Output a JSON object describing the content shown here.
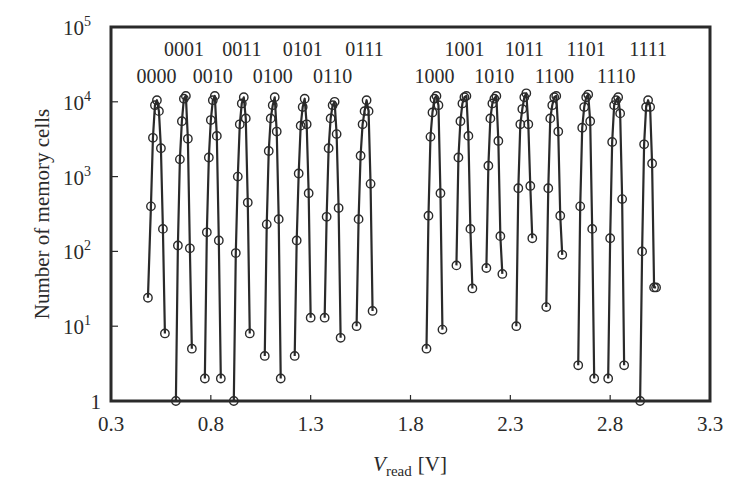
{
  "chart_data": {
    "type": "line",
    "title": "",
    "xlabel": "V_read [V]",
    "xlabel_main": "V",
    "xlabel_sub": "read",
    "xlabel_unit": "[V]",
    "ylabel": "Number of memory cells",
    "xscale": "linear",
    "yscale": "log",
    "xlim": [
      0.3,
      3.3
    ],
    "ylim": [
      1,
      100000
    ],
    "grid": false,
    "legend": null,
    "x_ticks": [
      "0.3",
      "0.8",
      "1.3",
      "1.8",
      "2.3",
      "2.8",
      "3.3"
    ],
    "x_tick_values": [
      0.3,
      0.8,
      1.3,
      1.8,
      2.3,
      2.8,
      3.3
    ],
    "y_ticks": [
      {
        "base": "1",
        "exp": "",
        "value": 1
      },
      {
        "base": "10",
        "exp": "1",
        "value": 10
      },
      {
        "base": "10",
        "exp": "2",
        "value": 100
      },
      {
        "base": "10",
        "exp": "3",
        "value": 1000
      },
      {
        "base": "10",
        "exp": "4",
        "value": 10000
      },
      {
        "base": "10",
        "exp": "5",
        "value": 100000
      }
    ],
    "marker": "open-circle",
    "series": [
      {
        "name": "0000",
        "label_row": "lower",
        "x": [
          0.485,
          0.5,
          0.51,
          0.52,
          0.53,
          0.54,
          0.55,
          0.56,
          0.57
        ],
        "y": [
          24,
          400,
          3300,
          9000,
          10500,
          7500,
          2400,
          200,
          8
        ]
      },
      {
        "name": "0001",
        "label_row": "upper",
        "x": [
          0.625,
          0.635,
          0.645,
          0.655,
          0.665,
          0.675,
          0.685,
          0.695,
          0.705
        ],
        "y": [
          1,
          120,
          1700,
          5500,
          11000,
          12000,
          3200,
          110,
          5
        ]
      },
      {
        "name": "0010",
        "label_row": "lower",
        "x": [
          0.77,
          0.78,
          0.79,
          0.8,
          0.81,
          0.82,
          0.83,
          0.84,
          0.85
        ],
        "y": [
          2,
          180,
          1800,
          5700,
          10500,
          12000,
          3500,
          140,
          2
        ]
      },
      {
        "name": "0011",
        "label_row": "upper",
        "x": [
          0.915,
          0.925,
          0.935,
          0.945,
          0.955,
          0.965,
          0.975,
          0.985,
          0.995
        ],
        "y": [
          1,
          95,
          1000,
          5000,
          9500,
          11500,
          6000,
          450,
          8
        ]
      },
      {
        "name": "0100",
        "label_row": "lower",
        "x": [
          1.07,
          1.08,
          1.09,
          1.1,
          1.11,
          1.12,
          1.13,
          1.14,
          1.15
        ],
        "y": [
          4,
          230,
          2200,
          6000,
          9000,
          11500,
          4000,
          270,
          2
        ]
      },
      {
        "name": "0101",
        "label_row": "upper",
        "x": [
          1.22,
          1.23,
          1.24,
          1.25,
          1.26,
          1.27,
          1.28,
          1.29,
          1.3
        ],
        "y": [
          4,
          140,
          1100,
          4800,
          8500,
          11000,
          5000,
          600,
          13
        ]
      },
      {
        "name": "0110",
        "label_row": "lower",
        "x": [
          1.37,
          1.38,
          1.39,
          1.4,
          1.41,
          1.42,
          1.43,
          1.44,
          1.45
        ],
        "y": [
          13,
          290,
          2400,
          6000,
          9000,
          10000,
          3700,
          380,
          7
        ]
      },
      {
        "name": "0111",
        "label_row": "upper",
        "x": [
          1.53,
          1.54,
          1.55,
          1.56,
          1.57,
          1.58,
          1.59,
          1.6,
          1.61
        ],
        "y": [
          10,
          270,
          1900,
          5000,
          7500,
          10500,
          7500,
          800,
          16
        ]
      },
      {
        "name": "1000",
        "label_row": "lower",
        "x": [
          1.88,
          1.89,
          1.9,
          1.91,
          1.92,
          1.93,
          1.94,
          1.95,
          1.96
        ],
        "y": [
          5,
          300,
          3400,
          7200,
          11000,
          12000,
          9000,
          600,
          9
        ]
      },
      {
        "name": "1001",
        "label_row": "upper",
        "x": [
          2.03,
          2.04,
          2.05,
          2.06,
          2.07,
          2.08,
          2.09,
          2.1,
          2.11
        ],
        "y": [
          65,
          1800,
          5500,
          9500,
          11500,
          12000,
          3500,
          200,
          32
        ]
      },
      {
        "name": "1010",
        "label_row": "lower",
        "x": [
          2.18,
          2.19,
          2.2,
          2.21,
          2.22,
          2.23,
          2.24,
          2.25,
          2.26
        ],
        "y": [
          60,
          1400,
          6000,
          9500,
          11000,
          12000,
          3000,
          160,
          50
        ]
      },
      {
        "name": "1011",
        "label_row": "upper",
        "x": [
          2.33,
          2.34,
          2.35,
          2.36,
          2.37,
          2.38,
          2.39,
          2.4,
          2.41
        ],
        "y": [
          10,
          700,
          5000,
          8000,
          11500,
          13000,
          5000,
          750,
          150
        ]
      },
      {
        "name": "1100",
        "label_row": "lower",
        "x": [
          2.48,
          2.49,
          2.5,
          2.51,
          2.52,
          2.53,
          2.54,
          2.55,
          2.56
        ],
        "y": [
          18,
          700,
          6000,
          9000,
          11500,
          12000,
          4000,
          300,
          90
        ]
      },
      {
        "name": "1101",
        "label_row": "upper",
        "x": [
          2.64,
          2.65,
          2.66,
          2.67,
          2.68,
          2.69,
          2.7,
          2.71,
          2.72
        ],
        "y": [
          3,
          400,
          4500,
          8500,
          11500,
          12500,
          5500,
          200,
          2
        ]
      },
      {
        "name": "1110",
        "label_row": "lower",
        "x": [
          2.79,
          2.8,
          2.81,
          2.82,
          2.83,
          2.84,
          2.85,
          2.86,
          2.87
        ],
        "y": [
          2,
          150,
          2900,
          9000,
          10500,
          11500,
          7000,
          500,
          3
        ]
      },
      {
        "name": "1111",
        "label_row": "upper",
        "x": [
          2.95,
          2.96,
          2.97,
          2.98,
          2.99,
          3.0,
          3.01,
          3.02,
          3.03
        ],
        "y": [
          1,
          100,
          2700,
          8500,
          10500,
          8500,
          1500,
          33,
          33
        ]
      }
    ],
    "annotations": [
      "0000",
      "0001",
      "0010",
      "0011",
      "0100",
      "0101",
      "0110",
      "0111",
      "1000",
      "1001",
      "1010",
      "1011",
      "1100",
      "1101",
      "1110",
      "1111"
    ]
  },
  "layout": {
    "plot_left": 111,
    "plot_right": 710,
    "plot_top": 27,
    "plot_bottom": 401,
    "line_color": "#2a2a2a",
    "marker_radius": 4.2
  }
}
